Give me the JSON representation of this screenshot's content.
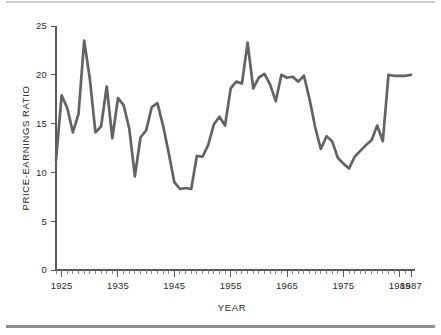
{
  "figure": {
    "background_color": "#ffffff",
    "line_color": "#636363",
    "axis_color": "#5a5a5a",
    "top_rule_color": "#c9c9c9",
    "bottom_rule_color": "#8f8f8f"
  },
  "chart_data": {
    "type": "line",
    "title": "",
    "xlabel": "YEAR",
    "ylabel": "PRICE-EARNINGS RATIO",
    "xlim": [
      1924,
      1987
    ],
    "ylim": [
      0,
      25
    ],
    "ytick_labels": [
      "0",
      "5",
      "10",
      "15",
      "20",
      "25"
    ],
    "yticks": [
      0,
      5,
      10,
      15,
      20,
      25
    ],
    "xtick_labels": [
      "1925",
      "1935",
      "1945",
      "1955",
      "1965",
      "1975",
      "1985",
      "1987"
    ],
    "xticks": [
      1925,
      1935,
      1945,
      1955,
      1965,
      1975,
      1985,
      1987
    ],
    "minor_xtick_interval": 1,
    "grid": false,
    "legend": null,
    "x": [
      1924,
      1925,
      1926,
      1927,
      1928,
      1929,
      1930,
      1931,
      1932,
      1933,
      1934,
      1935,
      1936,
      1937,
      1938,
      1939,
      1940,
      1941,
      1942,
      1943,
      1944,
      1945,
      1946,
      1947,
      1948,
      1949,
      1950,
      1951,
      1952,
      1953,
      1954,
      1955,
      1956,
      1957,
      1958,
      1959,
      1960,
      1961,
      1962,
      1963,
      1964,
      1965,
      1966,
      1967,
      1968,
      1969,
      1970,
      1971,
      1972,
      1973,
      1974,
      1975,
      1976,
      1977,
      1978,
      1979,
      1980,
      1981,
      1982,
      1983,
      1984,
      1985,
      1986,
      1987
    ],
    "values": [
      11.2,
      17.9,
      16.6,
      14.1,
      16.0,
      23.5,
      19.6,
      14.1,
      14.7,
      18.8,
      13.5,
      17.6,
      16.9,
      14.5,
      9.6,
      13.6,
      14.3,
      16.7,
      17.1,
      14.8,
      12.0,
      9.0,
      8.3,
      8.4,
      8.3,
      11.7,
      11.6,
      12.8,
      14.9,
      15.7,
      14.8,
      18.6,
      19.3,
      19.1,
      23.3,
      18.6,
      19.7,
      20.1,
      19.0,
      17.3,
      20.0,
      19.7,
      19.8,
      19.3,
      19.9,
      17.5,
      14.6,
      12.4,
      13.7,
      13.2,
      11.5,
      10.9,
      10.4,
      11.6,
      12.2,
      12.8,
      13.3,
      14.8,
      13.2,
      20.0,
      19.9,
      19.9,
      19.9,
      20.0
    ],
    "note": "Values approximated from pixel positions; 63 annual observations from 1924 through 1987."
  },
  "labels": {
    "y_axis_title": "PRICE-EARNINGS RATIO",
    "x_axis_title": "YEAR"
  }
}
